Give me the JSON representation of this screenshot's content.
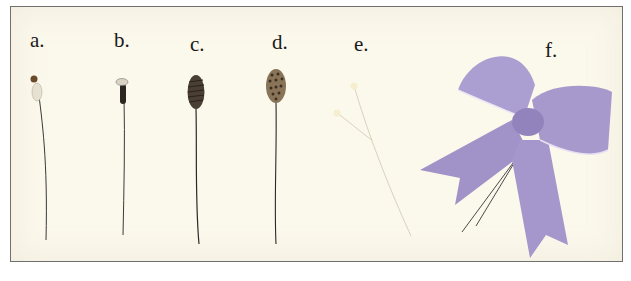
{
  "figure": {
    "labels": [
      {
        "id": "a",
        "text": "a."
      },
      {
        "id": "b",
        "text": "b."
      },
      {
        "id": "c",
        "text": "c."
      },
      {
        "id": "d",
        "text": "d."
      },
      {
        "id": "e",
        "text": "e."
      },
      {
        "id": "f",
        "text": "f."
      }
    ],
    "items": [
      {
        "id": "a",
        "description": "small dried flower head on wire stem"
      },
      {
        "id": "b",
        "description": "dark dried bud on wire stem"
      },
      {
        "id": "c",
        "description": "dark cone-shaped seed pod on wire stem"
      },
      {
        "id": "d",
        "description": "lotus-like seed pod on wire stem"
      },
      {
        "id": "e",
        "description": "two pearl-head pins"
      },
      {
        "id": "f",
        "description": "lavender velvet bow with wire stems"
      }
    ],
    "colors": {
      "background": "#fbf8ec",
      "border": "#6f6f6f",
      "bow": "#a99ccc",
      "bow_shadow": "#8e80b6",
      "stem": "#3a3a3a"
    }
  }
}
